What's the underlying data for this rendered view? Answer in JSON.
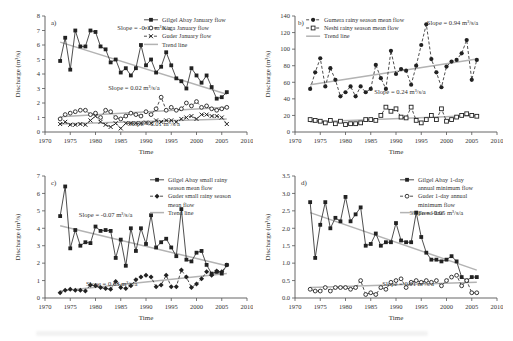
{
  "figure": {
    "colors": {
      "series": "#222222",
      "trend": "#b3b3b3",
      "axis": "#555555",
      "text": "#333333",
      "background": "#ffffff"
    }
  },
  "chart_data": [
    {
      "id": "a",
      "type": "line",
      "panel_label": "a)",
      "xlabel": "Time",
      "ylabel": "Discharge (m³/s)",
      "xlim": [
        1970,
        2010
      ],
      "xtick_step": 5,
      "ylim": [
        0,
        8
      ],
      "ytick_step": 1,
      "ytick_decimals": 0,
      "x_start": 1973,
      "grid": false,
      "legend_position": "top-right",
      "trend_label": "Trend line",
      "series": [
        {
          "name": "Gilgel Abay January flow",
          "marker": "square-filled",
          "dash": "solid",
          "values": [
            4.9,
            6.5,
            4.3,
            7.0,
            5.9,
            5.9,
            7.0,
            6.9,
            5.9,
            5.7,
            4.8,
            5.0,
            4.1,
            4.4,
            3.9,
            4.4,
            6.0,
            4.6,
            5.0,
            4.1,
            4.5,
            5.5,
            4.6,
            3.7,
            3.5,
            3.0,
            4.4,
            3.9,
            3.4,
            3.9,
            3.1,
            2.3,
            2.4,
            2.75
          ]
        },
        {
          "name": "Koga January flow",
          "marker": "circle-open",
          "dash": "dashed",
          "values": [
            0.9,
            1.2,
            1.3,
            1.4,
            1.5,
            1.5,
            1.2,
            1.3,
            1.0,
            1.5,
            1.4,
            1.0,
            0.9,
            1.1,
            1.3,
            1.2,
            1.1,
            1.4,
            1.2,
            1.6,
            2.4,
            1.5,
            1.7,
            1.5,
            1.6,
            2.0,
            1.8,
            2.1,
            1.7,
            1.8,
            1.6,
            1.5,
            1.6,
            1.7
          ]
        },
        {
          "name": "Guder January flow",
          "marker": "x",
          "dash": "dashed",
          "values": [
            0.55,
            0.7,
            0.5,
            0.5,
            0.55,
            0.5,
            0.8,
            1.1,
            0.7,
            0.5,
            0.35,
            0.6,
            0.25,
            0.6,
            0.6,
            0.6,
            0.6,
            0.65,
            0.6,
            0.8,
            0.7,
            0.8,
            0.8,
            0.7,
            0.9,
            1.0,
            1.1,
            0.9,
            1.2,
            1.2,
            1.1,
            1.1,
            1.0,
            0.55
          ]
        }
      ],
      "trends": [
        {
          "x": [
            1973,
            2006
          ],
          "y": [
            6.2,
            2.6
          ]
        },
        {
          "x": [
            1973,
            2006
          ],
          "y": [
            1.05,
            1.7
          ]
        },
        {
          "x": [
            1973,
            2006
          ],
          "y": [
            0.55,
            0.9
          ]
        }
      ],
      "annotations": [
        {
          "text": "Slope = -0.11 m³/s/a",
          "fx": 0.49,
          "fy": 0.12
        },
        {
          "text": "Slope = 0.02 m³/s/a",
          "fx": 0.44,
          "fy": 0.64
        },
        {
          "text": "Slope = 0.01 m³/s/a",
          "fx": 0.54,
          "fy": 0.95
        }
      ]
    },
    {
      "id": "b",
      "type": "line",
      "panel_label": "b)",
      "xlabel": "Time",
      "ylabel": "Discharge (m³/s)",
      "xlim": [
        1970,
        2010
      ],
      "xtick_step": 5,
      "ylim": [
        0,
        140
      ],
      "ytick_step": 20,
      "ytick_decimals": 0,
      "x_start": 1973,
      "grid": false,
      "legend_position": "top-left",
      "trend_label": "Trend line",
      "series": [
        {
          "name": "Gumera rainy season mean flow",
          "marker": "circle-filled",
          "dash": "dashed",
          "values": [
            52,
            72,
            89,
            55,
            77,
            63,
            43,
            48,
            55,
            43,
            55,
            48,
            52,
            81,
            65,
            52,
            98,
            70,
            76,
            74,
            57,
            80,
            105,
            130,
            88,
            72,
            54,
            79,
            85,
            87,
            95,
            111,
            63,
            87
          ]
        },
        {
          "name": "Neshi rainy season mean flow",
          "marker": "square-open",
          "dash": "dashed",
          "values": [
            15,
            14,
            13,
            11,
            14,
            10,
            13,
            9,
            10,
            10,
            11,
            15,
            15,
            14,
            20,
            30,
            25,
            28,
            18,
            17,
            30,
            14,
            11,
            15,
            20,
            15,
            28,
            13,
            15,
            18,
            20,
            22,
            20,
            19
          ]
        }
      ],
      "trends": [
        {
          "x": [
            1973,
            2006
          ],
          "y": [
            57,
            88
          ]
        },
        {
          "x": [
            1973,
            2006
          ],
          "y": [
            12,
            20
          ]
        }
      ],
      "annotations": [
        {
          "text": "Slope = 0.94 m³/s/a",
          "fx": 0.78,
          "fy": 0.08
        },
        {
          "text": "Slope = 0.24 m³/s/a",
          "fx": 0.52,
          "fy": 0.67
        }
      ]
    },
    {
      "id": "c",
      "type": "line",
      "panel_label": "c)",
      "xlabel": "Time",
      "ylabel": "Discharge (m³/s)",
      "xlim": [
        1970,
        2010
      ],
      "xtick_step": 5,
      "ylim": [
        0,
        7
      ],
      "ytick_step": 1,
      "ytick_decimals": 0,
      "x_start": 1973,
      "grid": false,
      "legend_position": "top-right",
      "trend_label": "Trend line",
      "series": [
        {
          "name": "Gilgel Abay small rainy season mean flow",
          "marker": "square-filled",
          "dash": "solid",
          "values": [
            4.7,
            6.4,
            2.85,
            3.9,
            3.0,
            3.2,
            3.15,
            4.1,
            3.85,
            3.9,
            3.85,
            2.3,
            3.35,
            1.85,
            4.0,
            2.7,
            4.0,
            3.1,
            4.75,
            2.9,
            3.2,
            3.4,
            2.9,
            2.4,
            5.1,
            2.2,
            2.1,
            2.6,
            2.7,
            1.9,
            1.4,
            1.5,
            1.4,
            1.9
          ]
        },
        {
          "name": "Guder small rainy season mean flow",
          "marker": "diamond-filled",
          "dash": "dashed",
          "values": [
            0.3,
            0.45,
            0.5,
            0.45,
            0.45,
            0.4,
            0.75,
            0.7,
            0.6,
            0.55,
            0.5,
            0.95,
            0.6,
            0.55,
            0.7,
            1.05,
            1.2,
            1.3,
            1.2,
            0.65,
            0.75,
            1.3,
            0.65,
            0.65,
            1.6,
            1.2,
            0.6,
            0.8,
            1.1,
            1.5,
            1.3,
            1.55,
            1.5,
            1.9
          ]
        }
      ],
      "trends": [
        {
          "x": [
            1973,
            2006
          ],
          "y": [
            4.15,
            1.85
          ]
        },
        {
          "x": [
            1973,
            2006
          ],
          "y": [
            0.4,
            1.4
          ]
        }
      ],
      "annotations": [
        {
          "text": "Slope = -0.07 m³/s/a",
          "fx": 0.3,
          "fy": 0.34
        },
        {
          "text": "Slope = 0.03 m³/s/a",
          "fx": 0.33,
          "fy": 0.9
        }
      ]
    },
    {
      "id": "d",
      "type": "line",
      "panel_label": "d)",
      "xlabel": "Time",
      "ylabel": "Discharge (m³/s)",
      "xlim": [
        1970,
        2010
      ],
      "xtick_step": 5,
      "ylim": [
        0,
        3.5
      ],
      "ytick_step": 0.5,
      "ytick_decimals": 1,
      "x_start": 1973,
      "grid": false,
      "legend_position": "top-right",
      "trend_label": "Trend line",
      "series": [
        {
          "name": "Gilgel Abay 1-day annual minimum flow",
          "marker": "square-filled",
          "dash": "solid",
          "values": [
            2.75,
            1.15,
            2.1,
            2.75,
            2.0,
            2.3,
            2.2,
            2.9,
            2.2,
            2.4,
            2.6,
            1.5,
            1.55,
            1.85,
            1.5,
            1.6,
            1.6,
            2.15,
            1.65,
            1.6,
            1.6,
            2.45,
            1.75,
            1.3,
            1.1,
            1.1,
            1.05,
            1.1,
            1.2,
            1.05,
            0.6,
            0.5,
            0.6,
            0.6
          ]
        },
        {
          "name": "Guder 1-day annual minimum flow",
          "marker": "circle-open",
          "dash": "dashed",
          "values": [
            0.25,
            0.2,
            0.2,
            0.3,
            0.2,
            0.3,
            0.3,
            0.3,
            0.25,
            0.3,
            0.5,
            0.1,
            0.15,
            0.1,
            0.3,
            0.25,
            0.45,
            0.5,
            0.55,
            0.3,
            0.45,
            0.5,
            0.45,
            0.5,
            0.45,
            0.5,
            0.35,
            0.5,
            0.6,
            0.65,
            0.35,
            0.5,
            0.15,
            0.15
          ]
        }
      ],
      "trends": [
        {
          "x": [
            1973,
            2006
          ],
          "y": [
            2.45,
            0.8
          ]
        },
        {
          "x": [
            1973,
            2006
          ],
          "y": [
            0.3,
            0.45
          ]
        }
      ],
      "annotations": [
        {
          "text": "Slope = -0.05 m³/s/a",
          "fx": 0.7,
          "fy": 0.32
        },
        {
          "text": "Slope = 0.01 m³/s/a",
          "fx": 0.56,
          "fy": 0.9
        }
      ]
    }
  ]
}
